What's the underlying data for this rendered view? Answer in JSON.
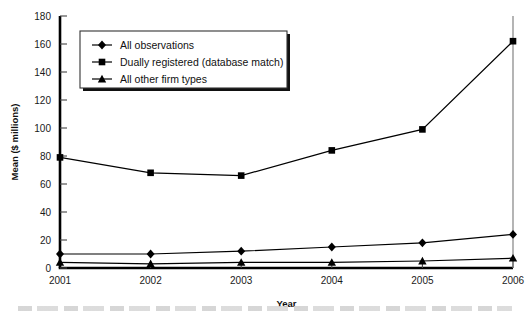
{
  "chart_data": {
    "type": "line",
    "title": "",
    "xlabel": "Year",
    "ylabel": "Mean ($ millions)",
    "categories": [
      "2001",
      "2002",
      "2003",
      "2004",
      "2005",
      "2006"
    ],
    "x": [
      2001,
      2002,
      2003,
      2004,
      2005,
      2006
    ],
    "xlim": [
      2001,
      2006
    ],
    "ylim": [
      0,
      180
    ],
    "yticks": [
      0,
      20,
      40,
      60,
      80,
      100,
      120,
      140,
      160,
      180
    ],
    "grid": false,
    "legend_position": "upper-left-inside",
    "series": [
      {
        "name": "All observations",
        "marker": "diamond",
        "color": "#000000",
        "values": [
          10,
          10,
          12,
          15,
          18,
          24
        ]
      },
      {
        "name": "Dually registered (database match)",
        "marker": "square",
        "color": "#000000",
        "values": [
          79,
          68,
          66,
          84,
          99,
          162
        ]
      },
      {
        "name": "All other firm types",
        "marker": "triangle",
        "color": "#000000",
        "values": [
          4,
          3,
          4,
          4,
          5,
          7
        ]
      }
    ]
  },
  "axes": {
    "y_title": "Mean ($ millions)",
    "x_title": "Year",
    "y_tick_labels": [
      "180",
      "160",
      "140",
      "120",
      "100",
      "80",
      "60",
      "40",
      "20",
      "0"
    ],
    "x_tick_labels": [
      "2001",
      "2002",
      "2003",
      "2004",
      "2005",
      "2006"
    ]
  },
  "legend": {
    "items": [
      {
        "label": "All observations",
        "marker": "diamond"
      },
      {
        "label": "Dually registered (database match)",
        "marker": "square"
      },
      {
        "label": "All other firm types",
        "marker": "triangle"
      }
    ]
  }
}
